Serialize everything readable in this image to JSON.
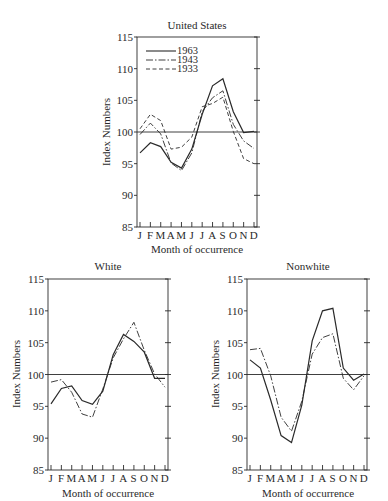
{
  "chart_data": [
    {
      "type": "line",
      "title": "United States",
      "xlabel": "Month of occurrence",
      "ylabel": "Index Numbers",
      "ylim": [
        85,
        115
      ],
      "yticks": [
        85,
        90,
        95,
        100,
        105,
        110,
        115
      ],
      "reference_line": 100,
      "categories": [
        "J",
        "F",
        "M",
        "A",
        "M",
        "J",
        "J",
        "A",
        "S",
        "O",
        "N",
        "D"
      ],
      "legend_position": "upper left",
      "series": [
        {
          "name": "1963",
          "style": "solid",
          "values": [
            96.7,
            98.3,
            97.7,
            95.2,
            94.3,
            97.3,
            102.8,
            107.3,
            108.4,
            103.2,
            99.9,
            100.1
          ]
        },
        {
          "name": "1943",
          "style": "dash-dot",
          "values": [
            99.6,
            101.4,
            99.7,
            95.1,
            93.9,
            96.7,
            103.2,
            105.4,
            106.5,
            101.2,
            98.6,
            97.4
          ]
        },
        {
          "name": "1933",
          "style": "dashed",
          "values": [
            100.5,
            102.8,
            101.8,
            97.3,
            97.6,
            99.2,
            104.0,
            104.5,
            105.5,
            100.1,
            95.8,
            95.0
          ]
        }
      ]
    },
    {
      "type": "line",
      "title": "White",
      "xlabel": "Month of occurrence",
      "ylabel": "Index Numbers",
      "ylim": [
        85,
        115
      ],
      "yticks": [
        85,
        90,
        95,
        100,
        105,
        110,
        115
      ],
      "reference_line": 100,
      "categories": [
        "J",
        "F",
        "M",
        "A",
        "M",
        "J",
        "J",
        "A",
        "S",
        "O",
        "N",
        "D"
      ],
      "series": [
        {
          "name": "1963",
          "style": "solid",
          "values": [
            95.4,
            97.8,
            98.2,
            95.9,
            95.3,
            97.4,
            103.1,
            106.3,
            105.2,
            103.5,
            99.4,
            99.4
          ]
        },
        {
          "name": "1943",
          "style": "dash-dot",
          "values": [
            98.8,
            99.2,
            97.2,
            93.8,
            93.3,
            97.7,
            102.6,
            105.6,
            108.2,
            103.8,
            100.1,
            98.0
          ]
        }
      ]
    },
    {
      "type": "line",
      "title": "Nonwhite",
      "xlabel": "Month of occurrence",
      "ylabel": "Index Numbers",
      "ylim": [
        85,
        115
      ],
      "yticks": [
        85,
        90,
        95,
        100,
        105,
        110,
        115
      ],
      "reference_line": 100,
      "categories": [
        "J",
        "F",
        "M",
        "A",
        "M",
        "J",
        "J",
        "A",
        "S",
        "O",
        "N",
        "D"
      ],
      "series": [
        {
          "name": "1963",
          "style": "solid",
          "values": [
            102.3,
            101.0,
            96.0,
            90.4,
            89.3,
            95.2,
            105.3,
            110.0,
            110.4,
            101.0,
            99.1,
            100.1
          ]
        },
        {
          "name": "1943",
          "style": "dash-dot",
          "values": [
            103.9,
            104.1,
            99.8,
            93.3,
            91.1,
            95.8,
            103.2,
            105.8,
            106.4,
            99.4,
            97.6,
            99.8
          ]
        }
      ]
    }
  ],
  "panels": {
    "us": {
      "title": "United States",
      "ylabel": "Index Numbers",
      "xlabel": "Month of occurrence"
    },
    "white": {
      "title": "White",
      "ylabel": "Index Numbers",
      "xlabel": "Month of occurrence"
    },
    "nonwhite": {
      "title": "Nonwhite",
      "ylabel": "Index Numbers",
      "xlabel": "Month of occurrence"
    }
  },
  "legend": [
    {
      "label": "1963",
      "style": "solid"
    },
    {
      "label": "1943",
      "style": "dash-dot"
    },
    {
      "label": "1933",
      "style": "dashed"
    }
  ],
  "axis": {
    "yticks": [
      "115",
      "110",
      "105",
      "100",
      "95",
      "90",
      "85"
    ],
    "months": [
      "J",
      "F",
      "M",
      "A",
      "M",
      "J",
      "J",
      "A",
      "S",
      "O",
      "N",
      "D"
    ]
  },
  "colors": {
    "ink": "#2a2a2a",
    "background": "#ffffff"
  }
}
